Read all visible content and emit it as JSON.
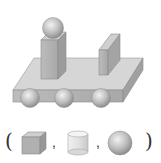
{
  "figure": {
    "parts": [
      {
        "name": "sphere-on-top",
        "shape": "sphere"
      },
      {
        "name": "tall-block",
        "shape": "cuboid"
      },
      {
        "name": "thin-slab",
        "shape": "cuboid"
      },
      {
        "name": "base-plate",
        "shape": "cuboid"
      },
      {
        "name": "wheel-1",
        "shape": "sphere"
      },
      {
        "name": "wheel-2",
        "shape": "sphere"
      },
      {
        "name": "wheel-3",
        "shape": "sphere"
      }
    ]
  },
  "answer_row": {
    "open_paren": "(",
    "close_paren": ")",
    "separator": ",",
    "options": [
      {
        "shape": "cube-icon"
      },
      {
        "shape": "cylinder-icon"
      },
      {
        "shape": "sphere-icon"
      }
    ]
  },
  "colors": {
    "light": "#d8d8d8",
    "mid": "#b8b8b8",
    "dark": "#9a9a9a",
    "edge": "#8a8a8a"
  }
}
